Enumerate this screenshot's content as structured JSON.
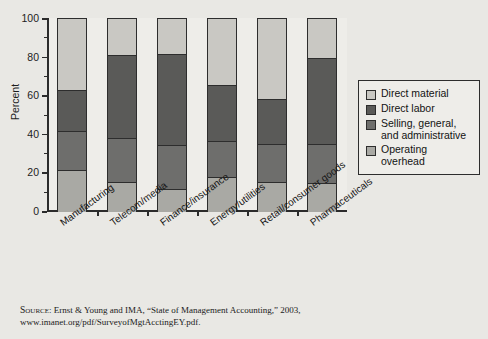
{
  "chart_data": {
    "type": "bar",
    "subtype": "stacked-bar-100",
    "title": "",
    "xlabel": "",
    "ylabel": "Percent",
    "ylim": [
      0,
      100
    ],
    "yticks": [
      0,
      20,
      40,
      60,
      80,
      100
    ],
    "ytick_labels": [
      "0",
      "20",
      "40",
      "60",
      "80",
      "100"
    ],
    "yminorticks": [
      10,
      30,
      50,
      70,
      90
    ],
    "grid": false,
    "legend_position": "right",
    "categories": [
      "Manufacturing",
      "Telecom/media",
      "Finance/insurance",
      "Energy/utilities",
      "Retail/consumer goods",
      "Pharmaceuticals"
    ],
    "series": [
      {
        "name": "Operating overhead",
        "color": "#a9a9a4",
        "values": [
          22,
          15.5,
          12,
          18,
          15.5,
          15
        ]
      },
      {
        "name": "Selling, general, and administrative",
        "color": "#6e6e6c",
        "values": [
          20,
          23,
          22.5,
          19,
          19.5,
          20
        ]
      },
      {
        "name": "Direct labor",
        "color": "#5a5a58",
        "values": [
          21,
          43,
          47.5,
          29,
          23.5,
          45
        ]
      },
      {
        "name": "Direct material",
        "color": "#c9c8c3",
        "values": [
          37,
          18.5,
          18,
          34,
          41.5,
          20
        ]
      }
    ],
    "cumulative_boundaries": [
      [
        22,
        42,
        63,
        100
      ],
      [
        15.5,
        38.5,
        81.5,
        100
      ],
      [
        12,
        34.5,
        82,
        100
      ],
      [
        18,
        37,
        66,
        100
      ],
      [
        15.5,
        35,
        58.5,
        100
      ],
      [
        15,
        35,
        80,
        100
      ]
    ],
    "stack_order_bottom_to_top": [
      "Operating overhead",
      "Selling, general, and administrative",
      "Direct labor",
      "Direct material"
    ]
  },
  "legend": {
    "items": [
      {
        "label": "Direct material",
        "label2": "",
        "color": "#c9c8c3"
      },
      {
        "label": "Direct labor",
        "label2": "",
        "color": "#5a5a58"
      },
      {
        "label": "Selling, general,",
        "label2": "and administrative",
        "color": "#6e6e6c"
      },
      {
        "label": "Operating overhead",
        "label2": "",
        "color": "#a9a9a4"
      }
    ]
  },
  "source": {
    "prefix": "Source",
    "line1": ": Ernst & Young and IMA, “State of Management Accounting,” 2003,",
    "line2": "www.imanet.org/pdf/SurveyofMgtAcctingEY.pdf."
  },
  "colors": {
    "background": "#e9e8e4",
    "plot_background": "#eeede9",
    "axis": "#2d2d2d",
    "text": "#1a1a1a"
  }
}
